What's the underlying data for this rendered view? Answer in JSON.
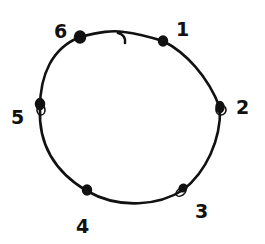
{
  "diagram": {
    "type": "cycle-graph",
    "style": "hand-drawn",
    "colors": {
      "ink": "#111111",
      "background": "#ffffff"
    },
    "nodes": [
      {
        "id": "1",
        "label": "1",
        "x": 163,
        "y": 41,
        "label_x": 176,
        "label_y": 36
      },
      {
        "id": "2",
        "label": "2",
        "x": 220,
        "y": 108,
        "label_x": 236,
        "label_y": 114
      },
      {
        "id": "3",
        "label": "3",
        "x": 183,
        "y": 190,
        "label_x": 195,
        "label_y": 218
      },
      {
        "id": "4",
        "label": "4",
        "x": 87,
        "y": 191,
        "label_x": 76,
        "label_y": 233
      },
      {
        "id": "5",
        "label": "5",
        "x": 40,
        "y": 108,
        "label_x": 11,
        "label_y": 124
      },
      {
        "id": "6",
        "label": "6",
        "x": 80,
        "y": 37,
        "label_x": 54,
        "label_y": 38
      }
    ],
    "edges": [
      {
        "from": "1",
        "to": "2"
      },
      {
        "from": "2",
        "to": "3"
      },
      {
        "from": "3",
        "to": "4"
      },
      {
        "from": "4",
        "to": "5"
      },
      {
        "from": "5",
        "to": "6"
      },
      {
        "from": "6",
        "to": "1"
      }
    ]
  }
}
